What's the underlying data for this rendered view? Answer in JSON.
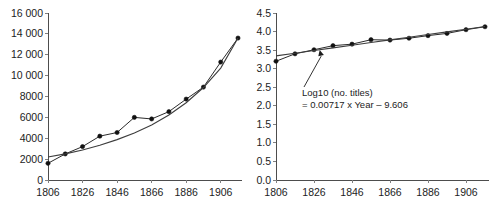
{
  "figure": {
    "background": "#ffffff",
    "line_color": "#2b2b2b",
    "marker_color": "#101010",
    "axis_color": "#4d4d4d"
  },
  "chart_data": [
    {
      "id": "left",
      "type": "line",
      "title": "",
      "xlabel": "",
      "ylabel": "",
      "xlim": [
        1806,
        1916
      ],
      "ylim": [
        0,
        16000
      ],
      "grid": false,
      "legend": null,
      "xticks": [
        1806,
        1826,
        1846,
        1866,
        1886,
        1906
      ],
      "xticklabels": [
        "1806",
        "1826",
        "1846",
        "1866",
        "1886",
        "1906"
      ],
      "yticks": [
        0,
        2000,
        4000,
        6000,
        8000,
        10000,
        12000,
        14000,
        16000
      ],
      "yticklabels": [
        "0",
        "2000",
        "4000",
        "6000",
        "8000",
        "10 000",
        "12 000",
        "14 000",
        "16 000"
      ],
      "x": [
        1806,
        1816,
        1826,
        1836,
        1846,
        1856,
        1866,
        1876,
        1886,
        1896,
        1906,
        1916
      ],
      "series": [
        {
          "name": "no. titles",
          "kind": "markers-line",
          "values": [
            1600,
            2500,
            3200,
            4200,
            4550,
            6000,
            5850,
            6550,
            7750,
            8900,
            11300,
            13600
          ]
        },
        {
          "name": "exponential fit",
          "kind": "smooth",
          "values": [
            2200,
            2500,
            2880,
            3330,
            3870,
            4510,
            5280,
            6230,
            7400,
            8860,
            10720,
            13600
          ]
        }
      ]
    },
    {
      "id": "right",
      "type": "line",
      "title": "",
      "xlabel": "",
      "ylabel": "",
      "xlim": [
        1806,
        1916
      ],
      "ylim": [
        0.0,
        4.5
      ],
      "grid": false,
      "legend": null,
      "xticks": [
        1806,
        1826,
        1846,
        1866,
        1886,
        1906
      ],
      "xticklabels": [
        "1806",
        "1826",
        "1846",
        "1866",
        "1886",
        "1906"
      ],
      "yticks": [
        0.0,
        0.5,
        1.0,
        1.5,
        2.0,
        2.5,
        3.0,
        3.5,
        4.0,
        4.5
      ],
      "yticklabels": [
        "0.0",
        "0.5",
        "1.0",
        "1.5",
        "2.0",
        "2.5",
        "3.0",
        "3.5",
        "4.0",
        "4.5"
      ],
      "x": [
        1806,
        1816,
        1826,
        1836,
        1846,
        1856,
        1866,
        1876,
        1886,
        1896,
        1906,
        1916
      ],
      "series": [
        {
          "name": "Log10 (no. titles)",
          "kind": "markers-line",
          "values": [
            3.2,
            3.4,
            3.51,
            3.62,
            3.66,
            3.78,
            3.77,
            3.82,
            3.89,
            3.95,
            4.05,
            4.13
          ]
        },
        {
          "name": "linear fit",
          "kind": "smooth",
          "values": [
            3.345,
            3.417,
            3.489,
            3.56,
            3.632,
            3.704,
            3.775,
            3.847,
            3.919,
            3.991,
            4.062,
            4.134
          ]
        }
      ],
      "annotations": [
        {
          "name": "regression-equation",
          "line1": "Log10 (no. titles)",
          "line2": "= 0.00717 x Year – 9.606",
          "points_to_x": 1829,
          "points_to_y": 3.5
        }
      ]
    }
  ]
}
